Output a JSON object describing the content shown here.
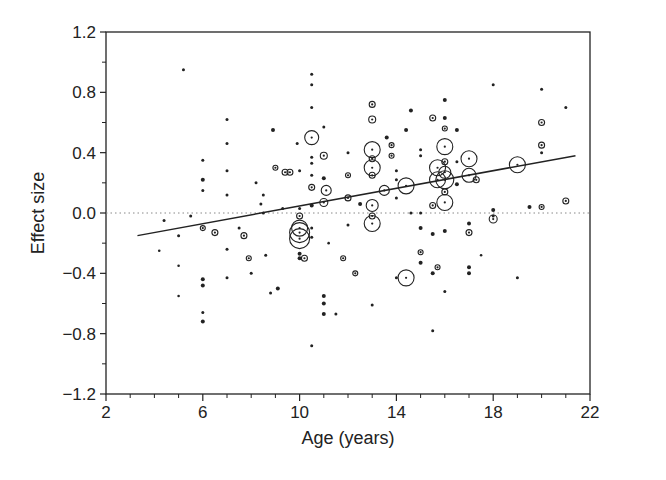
{
  "chart_data": {
    "type": "scatter",
    "title": "",
    "xlabel": "Age (years)",
    "ylabel": "Effect size",
    "xlim": [
      2,
      22
    ],
    "ylim": [
      -1.2,
      1.2
    ],
    "x_ticks": [
      2,
      6,
      10,
      14,
      18,
      22
    ],
    "x_tick_labels": [
      "2",
      "6",
      "10",
      "14",
      "18",
      "22"
    ],
    "y_ticks": [
      1.2,
      0.8,
      0.4,
      0.0,
      -0.4,
      -0.8,
      -1.2
    ],
    "y_tick_labels": [
      "1.2",
      "0.8",
      "0.4",
      "0.0",
      "−0.4",
      "−0.8",
      "−1.2"
    ],
    "grid": false,
    "reference_line": {
      "y": 0.0,
      "style": "dotted"
    },
    "regression_line": {
      "x": [
        3.3,
        21.4
      ],
      "y": [
        -0.15,
        0.38
      ]
    },
    "marker_note": "Open circles sized by study weight",
    "points": [
      {
        "x": 5.2,
        "y": 0.95,
        "r": 1.5
      },
      {
        "x": 4.4,
        "y": -0.05,
        "r": 1.5
      },
      {
        "x": 4.2,
        "y": -0.25,
        "r": 1.2
      },
      {
        "x": 5.0,
        "y": -0.15,
        "r": 1.5
      },
      {
        "x": 5.0,
        "y": -0.35,
        "r": 1.2
      },
      {
        "x": 5.0,
        "y": -0.55,
        "r": 1.2
      },
      {
        "x": 6.0,
        "y": 0.35,
        "r": 1.5
      },
      {
        "x": 6.0,
        "y": 0.22,
        "r": 2
      },
      {
        "x": 6.0,
        "y": 0.15,
        "r": 1.5
      },
      {
        "x": 6.0,
        "y": -0.1,
        "r": 2.5
      },
      {
        "x": 6.0,
        "y": -0.44,
        "r": 2
      },
      {
        "x": 6.0,
        "y": -0.48,
        "r": 2
      },
      {
        "x": 6.0,
        "y": -0.66,
        "r": 1.5
      },
      {
        "x": 6.0,
        "y": -0.72,
        "r": 2
      },
      {
        "x": 5.5,
        "y": -0.02,
        "r": 1.5
      },
      {
        "x": 6.5,
        "y": -0.13,
        "r": 3
      },
      {
        "x": 7.0,
        "y": 0.62,
        "r": 1.5
      },
      {
        "x": 7.0,
        "y": 0.46,
        "r": 1.5
      },
      {
        "x": 7.0,
        "y": 0.28,
        "r": 1.5
      },
      {
        "x": 7.0,
        "y": 0.12,
        "r": 1.5
      },
      {
        "x": 7.0,
        "y": -0.43,
        "r": 1.5
      },
      {
        "x": 7.0,
        "y": -0.24,
        "r": 1.5
      },
      {
        "x": 7.5,
        "y": -0.1,
        "r": 1.5
      },
      {
        "x": 7.7,
        "y": -0.15,
        "r": 3
      },
      {
        "x": 7.9,
        "y": -0.3,
        "r": 2.5
      },
      {
        "x": 8.2,
        "y": 0.2,
        "r": 1.5
      },
      {
        "x": 8.0,
        "y": -0.4,
        "r": 1.5
      },
      {
        "x": 8.5,
        "y": 0.12,
        "r": 1.5
      },
      {
        "x": 8.4,
        "y": 0.06,
        "r": 1.5
      },
      {
        "x": 8.5,
        "y": 0.0,
        "r": 1.5
      },
      {
        "x": 8.6,
        "y": -0.28,
        "r": 1.5
      },
      {
        "x": 8.8,
        "y": -0.53,
        "r": 1.5
      },
      {
        "x": 8.9,
        "y": 0.55,
        "r": 2
      },
      {
        "x": 9.0,
        "y": 0.3,
        "r": 2.5
      },
      {
        "x": 9.1,
        "y": -0.5,
        "r": 2
      },
      {
        "x": 9.3,
        "y": 0.03,
        "r": 1.5
      },
      {
        "x": 9.4,
        "y": 0.27,
        "r": 3
      },
      {
        "x": 9.6,
        "y": 0.27,
        "r": 3
      },
      {
        "x": 9.9,
        "y": 0.46,
        "r": 1.5
      },
      {
        "x": 10.0,
        "y": 0.28,
        "r": 1.5
      },
      {
        "x": 10.0,
        "y": 0.03,
        "r": 1.5
      },
      {
        "x": 10.0,
        "y": -0.02,
        "r": 3
      },
      {
        "x": 10.0,
        "y": -0.1,
        "r": 8
      },
      {
        "x": 10.0,
        "y": -0.13,
        "r": 10
      },
      {
        "x": 10.0,
        "y": -0.17,
        "r": 10
      },
      {
        "x": 10.0,
        "y": -0.27,
        "r": 2
      },
      {
        "x": 10.0,
        "y": -0.3,
        "r": 2
      },
      {
        "x": 10.2,
        "y": -0.3,
        "r": 3
      },
      {
        "x": 10.5,
        "y": 0.92,
        "r": 1.5
      },
      {
        "x": 10.5,
        "y": 0.85,
        "r": 1.5
      },
      {
        "x": 10.5,
        "y": 0.7,
        "r": 1.5
      },
      {
        "x": 10.5,
        "y": 0.5,
        "r": 7
      },
      {
        "x": 10.5,
        "y": 0.37,
        "r": 1.5
      },
      {
        "x": 10.5,
        "y": 0.33,
        "r": 1.5
      },
      {
        "x": 10.5,
        "y": 0.25,
        "r": 1.5
      },
      {
        "x": 10.5,
        "y": 0.17,
        "r": 3
      },
      {
        "x": 10.5,
        "y": 0.05,
        "r": 2
      },
      {
        "x": 10.5,
        "y": -0.88,
        "r": 1.5
      },
      {
        "x": 10.5,
        "y": -0.1,
        "r": 1.5
      },
      {
        "x": 10.5,
        "y": -0.16,
        "r": 1.5
      },
      {
        "x": 11.0,
        "y": 0.57,
        "r": 1.5
      },
      {
        "x": 11.0,
        "y": 0.38,
        "r": 3.5
      },
      {
        "x": 11.0,
        "y": 0.23,
        "r": 2
      },
      {
        "x": 11.1,
        "y": 0.15,
        "r": 5
      },
      {
        "x": 11.0,
        "y": 0.07,
        "r": 4
      },
      {
        "x": 11.0,
        "y": -0.55,
        "r": 2
      },
      {
        "x": 11.0,
        "y": -0.6,
        "r": 2
      },
      {
        "x": 11.0,
        "y": -0.67,
        "r": 2
      },
      {
        "x": 11.2,
        "y": -0.2,
        "r": 1
      },
      {
        "x": 11.5,
        "y": -0.67,
        "r": 1.5
      },
      {
        "x": 11.8,
        "y": -0.3,
        "r": 2.5
      },
      {
        "x": 12.0,
        "y": 0.4,
        "r": 1.5
      },
      {
        "x": 12.0,
        "y": 0.25,
        "r": 2.5
      },
      {
        "x": 12.0,
        "y": 0.1,
        "r": 3
      },
      {
        "x": 12.0,
        "y": -0.08,
        "r": 1.5
      },
      {
        "x": 12.3,
        "y": -0.4,
        "r": 2.5
      },
      {
        "x": 12.5,
        "y": 0.06,
        "r": 2
      },
      {
        "x": 13.0,
        "y": 0.72,
        "r": 3
      },
      {
        "x": 13.0,
        "y": 0.62,
        "r": 3.5
      },
      {
        "x": 13.0,
        "y": 0.42,
        "r": 8
      },
      {
        "x": 13.0,
        "y": 0.36,
        "r": 3
      },
      {
        "x": 13.0,
        "y": 0.3,
        "r": 8
      },
      {
        "x": 13.0,
        "y": 0.25,
        "r": 3
      },
      {
        "x": 13.0,
        "y": 0.05,
        "r": 6
      },
      {
        "x": 13.0,
        "y": -0.07,
        "r": 8
      },
      {
        "x": 13.0,
        "y": -0.02,
        "r": 3
      },
      {
        "x": 13.0,
        "y": -0.61,
        "r": 1.5
      },
      {
        "x": 13.5,
        "y": 0.15,
        "r": 5
      },
      {
        "x": 13.6,
        "y": 0.5,
        "r": 2
      },
      {
        "x": 13.8,
        "y": 0.45,
        "r": 2.5
      },
      {
        "x": 13.8,
        "y": 0.38,
        "r": 2.5
      },
      {
        "x": 14.0,
        "y": 0.28,
        "r": 1.5
      },
      {
        "x": 14.0,
        "y": 0.22,
        "r": 1.5
      },
      {
        "x": 14.0,
        "y": -0.43,
        "r": 1.5
      },
      {
        "x": 14.4,
        "y": 0.18,
        "r": 8
      },
      {
        "x": 14.4,
        "y": -0.43,
        "r": 8
      },
      {
        "x": 14.0,
        "y": 0.1,
        "r": 1.5
      },
      {
        "x": 14.4,
        "y": 0.55,
        "r": 2
      },
      {
        "x": 14.6,
        "y": 0.68,
        "r": 2
      },
      {
        "x": 14.6,
        "y": 0.0,
        "r": 1.5
      },
      {
        "x": 15.0,
        "y": 0.0,
        "r": 1.5
      },
      {
        "x": 15.0,
        "y": -0.1,
        "r": 2
      },
      {
        "x": 15.0,
        "y": 0.42,
        "r": 1.5
      },
      {
        "x": 15.0,
        "y": 0.38,
        "r": 1.5
      },
      {
        "x": 15.0,
        "y": -0.26,
        "r": 2.5
      },
      {
        "x": 15.0,
        "y": -0.33,
        "r": 2
      },
      {
        "x": 15.5,
        "y": 0.63,
        "r": 3
      },
      {
        "x": 15.5,
        "y": 0.05,
        "r": 3
      },
      {
        "x": 15.5,
        "y": -0.78,
        "r": 1.5
      },
      {
        "x": 15.5,
        "y": -0.4,
        "r": 2
      },
      {
        "x": 15.5,
        "y": -0.14,
        "r": 2
      },
      {
        "x": 15.7,
        "y": 0.3,
        "r": 8
      },
      {
        "x": 15.7,
        "y": 0.22,
        "r": 8
      },
      {
        "x": 15.7,
        "y": -0.36,
        "r": 2.5
      },
      {
        "x": 16.0,
        "y": 0.75,
        "r": 2
      },
      {
        "x": 16.0,
        "y": 0.63,
        "r": 2
      },
      {
        "x": 16.0,
        "y": 0.56,
        "r": 2.5
      },
      {
        "x": 16.0,
        "y": 0.44,
        "r": 8
      },
      {
        "x": 16.0,
        "y": 0.34,
        "r": 3
      },
      {
        "x": 16.0,
        "y": 0.27,
        "r": 6
      },
      {
        "x": 16.0,
        "y": 0.22,
        "r": 9
      },
      {
        "x": 16.0,
        "y": 0.14,
        "r": 3
      },
      {
        "x": 16.0,
        "y": 0.07,
        "r": 8
      },
      {
        "x": 16.0,
        "y": -0.52,
        "r": 1.5
      },
      {
        "x": 16.0,
        "y": -0.12,
        "r": 2
      },
      {
        "x": 16.5,
        "y": 0.55,
        "r": 2
      },
      {
        "x": 16.5,
        "y": 0.34,
        "r": 1.5
      },
      {
        "x": 16.5,
        "y": 0.19,
        "r": 2
      },
      {
        "x": 17.0,
        "y": 0.36,
        "r": 8
      },
      {
        "x": 17.0,
        "y": 0.25,
        "r": 7
      },
      {
        "x": 17.0,
        "y": -0.13,
        "r": 3
      },
      {
        "x": 17.0,
        "y": -0.36,
        "r": 2
      },
      {
        "x": 17.0,
        "y": -0.4,
        "r": 2
      },
      {
        "x": 17.0,
        "y": -0.07,
        "r": 2
      },
      {
        "x": 17.3,
        "y": 0.22,
        "r": 3
      },
      {
        "x": 17.5,
        "y": -0.28,
        "r": 1
      },
      {
        "x": 18.0,
        "y": 0.85,
        "r": 1.5
      },
      {
        "x": 18.0,
        "y": 0.02,
        "r": 2
      },
      {
        "x": 18.0,
        "y": -0.04,
        "r": 4
      },
      {
        "x": 18.0,
        "y": -0.02,
        "r": 1.5
      },
      {
        "x": 19.0,
        "y": 0.32,
        "r": 8
      },
      {
        "x": 19.0,
        "y": -0.43,
        "r": 1.5
      },
      {
        "x": 19.5,
        "y": 0.04,
        "r": 2
      },
      {
        "x": 20.0,
        "y": 0.82,
        "r": 1.5
      },
      {
        "x": 20.0,
        "y": 0.6,
        "r": 3
      },
      {
        "x": 20.0,
        "y": 0.45,
        "r": 3
      },
      {
        "x": 20.0,
        "y": 0.4,
        "r": 1.5
      },
      {
        "x": 20.0,
        "y": 0.04,
        "r": 2.5
      },
      {
        "x": 21.0,
        "y": 0.7,
        "r": 1.5
      },
      {
        "x": 21.0,
        "y": 0.08,
        "r": 3
      }
    ]
  }
}
